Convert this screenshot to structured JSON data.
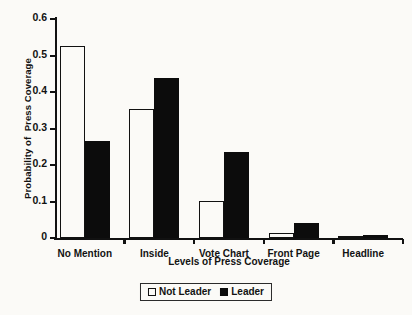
{
  "chart_data": {
    "type": "bar",
    "title": "",
    "xlabel": "Levels of Press Coverage",
    "ylabel": "Probability of  Press Coverage",
    "categories": [
      "No Mention",
      "Inside",
      "Vote Chart",
      "Front Page",
      "Headline"
    ],
    "series": [
      {
        "name": "Not Leader",
        "fill": "#ffffff",
        "edge": "#111111",
        "values": [
          0.525,
          0.354,
          0.101,
          0.013,
          0.001
        ]
      },
      {
        "name": "Leader",
        "fill": "#0c0c0c",
        "edge": "#0c0c0c",
        "values": [
          0.267,
          0.438,
          0.236,
          0.04,
          0.008
        ]
      }
    ],
    "ylim": [
      0,
      0.6
    ],
    "yticks": [
      0,
      0.1,
      0.2,
      0.3,
      0.4,
      0.5,
      0.6
    ],
    "ytick_labels": [
      "0",
      "0.1",
      "0.2",
      "0.3",
      "0.4",
      "0.5",
      "0.6"
    ],
    "grid": false,
    "legend_position": "bottom-center"
  },
  "legend": {
    "entries": [
      {
        "label": "Not Leader",
        "swatch": "open-square-icon"
      },
      {
        "label": "Leader",
        "swatch": "filled-square-icon"
      }
    ]
  }
}
